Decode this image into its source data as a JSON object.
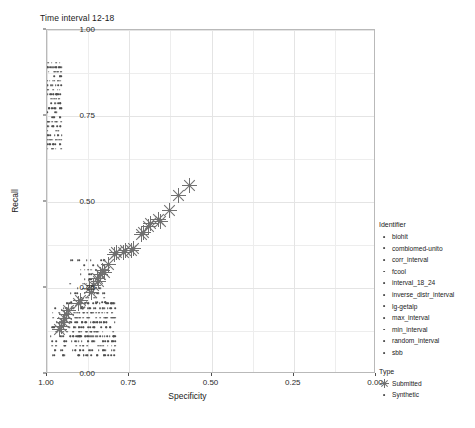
{
  "chart_data": {
    "type": "scatter",
    "title": "Time interval 12-18",
    "xlabel": "Specificity",
    "ylabel": "Recall",
    "xlim": [
      1.0,
      0.0
    ],
    "ylim": [
      0.0,
      1.0
    ],
    "x_reversed": true,
    "grid": true,
    "xticks": [
      1.0,
      0.75,
      0.5,
      0.25,
      0.0
    ],
    "xtick_labels": [
      "1.00",
      "0.75",
      "0.50",
      "0.25",
      "0.00"
    ],
    "yticks": [
      0.0,
      0.25,
      0.5,
      0.75,
      1.0
    ],
    "ytick_labels": [
      "0.00",
      "0.25",
      "0.50",
      "0.75",
      "1.00"
    ],
    "legend_position": "right",
    "series": [
      {
        "name": "Submitted",
        "marker": "asterisk",
        "color": "#707070",
        "points": [
          [
            0.963,
            0.128
          ],
          [
            0.957,
            0.139
          ],
          [
            0.951,
            0.15
          ],
          [
            0.947,
            0.162
          ],
          [
            0.94,
            0.173
          ],
          [
            0.934,
            0.185
          ],
          [
            0.905,
            0.205
          ],
          [
            0.898,
            0.214
          ],
          [
            0.872,
            0.248
          ],
          [
            0.866,
            0.238
          ],
          [
            0.86,
            0.258
          ],
          [
            0.848,
            0.279
          ],
          [
            0.842,
            0.27
          ],
          [
            0.838,
            0.288
          ],
          [
            0.83,
            0.302
          ],
          [
            0.826,
            0.296
          ],
          [
            0.812,
            0.318
          ],
          [
            0.795,
            0.346
          ],
          [
            0.788,
            0.352
          ],
          [
            0.766,
            0.352
          ],
          [
            0.76,
            0.358
          ],
          [
            0.742,
            0.36
          ],
          [
            0.736,
            0.366
          ],
          [
            0.712,
            0.406
          ],
          [
            0.706,
            0.412
          ],
          [
            0.69,
            0.43
          ],
          [
            0.684,
            0.438
          ],
          [
            0.66,
            0.45
          ],
          [
            0.654,
            0.443
          ],
          [
            0.628,
            0.476
          ],
          [
            0.6,
            0.52
          ],
          [
            0.566,
            0.548
          ]
        ]
      },
      {
        "name": "Synthetic",
        "marker": "dot",
        "color": "#4d4d4d",
        "clusters": [
          {
            "note": "upper-left dense band",
            "x_range": [
              0.955,
              1.005
            ],
            "y_range": [
              0.655,
              0.905
            ],
            "count": 150
          },
          {
            "note": "mid diagonal scatter",
            "x_range": [
              0.82,
              0.935
            ],
            "y_range": [
              0.195,
              0.33
            ],
            "count": 70
          },
          {
            "note": "lower dense bands",
            "x_range": [
              0.79,
              0.99
            ],
            "y_range": [
              0.055,
              0.205
            ],
            "count": 320
          },
          {
            "note": "isolated zero-recall point",
            "x_range": [
              0.995,
              1.0
            ],
            "y_range": [
              0.0,
              0.0
            ],
            "count": 1
          }
        ]
      }
    ],
    "legend_identifier_title": "Identifier",
    "legend_identifier_items": [
      "biohit",
      "combiomed-unito",
      "corr_interval",
      "fcool",
      "interval_18_24",
      "inverse_distr_interval",
      "lg-getalp",
      "max_interval",
      "min_interval",
      "random_interval",
      "sbb"
    ],
    "legend_type_title": "Type",
    "legend_type_items": [
      {
        "label": "Submitted",
        "marker": "asterisk"
      },
      {
        "label": "Synthetic",
        "marker": "dot"
      }
    ]
  }
}
